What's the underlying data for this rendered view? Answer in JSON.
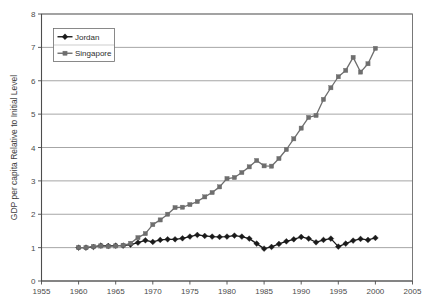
{
  "chart_data": {
    "type": "line",
    "title": "",
    "subtitle": "",
    "xlabel": "",
    "ylabel": "GDP per capita Relative to Initial Level",
    "xlim": [
      1955,
      2005
    ],
    "ylim": [
      0,
      8
    ],
    "x_ticks": [
      1955,
      1960,
      1965,
      1970,
      1975,
      1980,
      1985,
      1990,
      1995,
      2000,
      2005
    ],
    "y_ticks": [
      0,
      1,
      2,
      3,
      4,
      5,
      6,
      7,
      8
    ],
    "grid": "horizontal",
    "legend_position": "top-left-inside",
    "x": [
      1960,
      1961,
      1962,
      1963,
      1964,
      1965,
      1966,
      1967,
      1968,
      1969,
      1970,
      1971,
      1972,
      1973,
      1974,
      1975,
      1976,
      1977,
      1978,
      1979,
      1980,
      1981,
      1982,
      1983,
      1984,
      1985,
      1986,
      1987,
      1988,
      1989,
      1990,
      1991,
      1992,
      1993,
      1994,
      1995,
      1996,
      1997,
      1998,
      1999,
      2000
    ],
    "series": [
      {
        "name": "Jordan",
        "color": "#1a1a1a",
        "marker": "diamond",
        "values": [
          1.0,
          1.0,
          1.02,
          1.06,
          1.05,
          1.06,
          1.06,
          1.09,
          1.15,
          1.22,
          1.17,
          1.23,
          1.25,
          1.25,
          1.28,
          1.33,
          1.38,
          1.35,
          1.33,
          1.32,
          1.33,
          1.36,
          1.33,
          1.27,
          1.12,
          0.97,
          1.02,
          1.11,
          1.19,
          1.25,
          1.32,
          1.27,
          1.16,
          1.23,
          1.27,
          1.03,
          1.12,
          1.21,
          1.26,
          1.23,
          1.29
        ]
      },
      {
        "name": "Singapore",
        "color": "#6e6e6e",
        "marker": "square",
        "values": [
          1.0,
          1.0,
          1.03,
          1.05,
          1.04,
          1.05,
          1.07,
          1.13,
          1.3,
          1.42,
          1.69,
          1.83,
          2.0,
          2.2,
          2.21,
          2.29,
          2.38,
          2.52,
          2.65,
          2.82,
          3.07,
          3.1,
          3.25,
          3.42,
          3.61,
          3.45,
          3.44,
          3.67,
          3.94,
          4.26,
          4.58,
          4.9,
          4.96,
          5.44,
          5.79,
          6.12,
          6.31,
          6.7,
          6.26,
          6.51,
          6.97
        ]
      }
    ],
    "legend": [
      {
        "label": "Jordan",
        "color": "#1a1a1a",
        "marker": "diamond"
      },
      {
        "label": "Singapore",
        "color": "#6e6e6e",
        "marker": "square"
      }
    ]
  }
}
